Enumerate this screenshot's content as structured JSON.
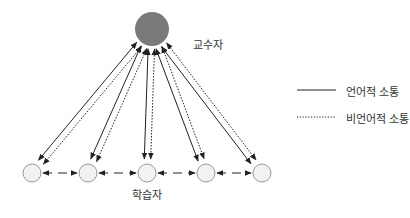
{
  "diagram": {
    "teacher": {
      "label": "교수자",
      "cx": 152,
      "cy": 29,
      "r": 17,
      "fill": "#7a7a7a"
    },
    "students": {
      "label": "학습자",
      "cy": 173,
      "r": 9,
      "fill": "#f2f2f2",
      "stroke": "#999999",
      "xs": [
        32,
        88,
        147,
        206,
        262
      ]
    },
    "legend": {
      "verbal": {
        "label": "언어적 소통",
        "style": "solid"
      },
      "nonverbal": {
        "label": "비언어적 소통",
        "style": "dotted"
      }
    },
    "colors": {
      "line": "#222222"
    }
  }
}
